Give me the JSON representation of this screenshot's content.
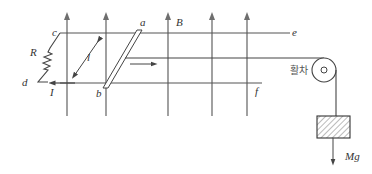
{
  "diagram": {
    "labels": {
      "a": "a",
      "b": "b",
      "B": "B",
      "c": "c",
      "d": "d",
      "e": "e",
      "f": "f",
      "R": "R",
      "l": "l",
      "I": "I",
      "pulley": "활차",
      "weight": "Mg"
    },
    "colors": {
      "line": "#555555",
      "field_arrow": "#6e6e6e",
      "hatch": "#777777"
    }
  }
}
